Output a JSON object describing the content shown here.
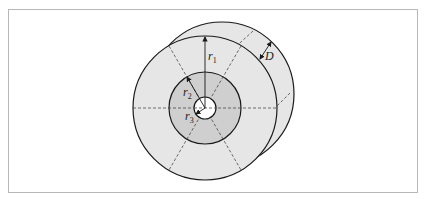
{
  "figure": {
    "type": "annular-disk-diagram",
    "labels": {
      "r1": {
        "base": "r",
        "sub": "1"
      },
      "r2": {
        "base": "r",
        "sub": "2"
      },
      "r3": {
        "base": "r",
        "sub": "3"
      },
      "D": "D"
    },
    "colors": {
      "outer_ring": "#e6e6e6",
      "middle_ring": "#cfcfcf",
      "inner_hole": "#ffffff",
      "stroke": "#1a1a1a",
      "frame": "#b8b8b8"
    }
  }
}
